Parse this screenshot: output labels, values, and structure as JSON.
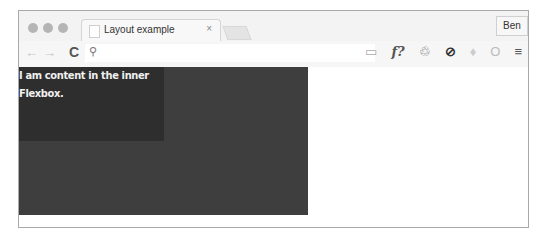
{
  "browser": {
    "tab": {
      "title": "Layout example",
      "close": "×"
    },
    "profile": "Ben",
    "toolbar": {
      "back": "←",
      "forward": "→",
      "reload": "C",
      "search_icon": "⚲",
      "extensions": [
        "▭",
        "f?",
        "♲",
        "⊘",
        "♦",
        "O",
        "≡"
      ]
    }
  },
  "page": {
    "inner_text": "I am content in the inner Flexbox.",
    "colors": {
      "outer": "#3e3e3e",
      "inner": "#2e2e2e",
      "text": "#f0f0f0"
    }
  }
}
